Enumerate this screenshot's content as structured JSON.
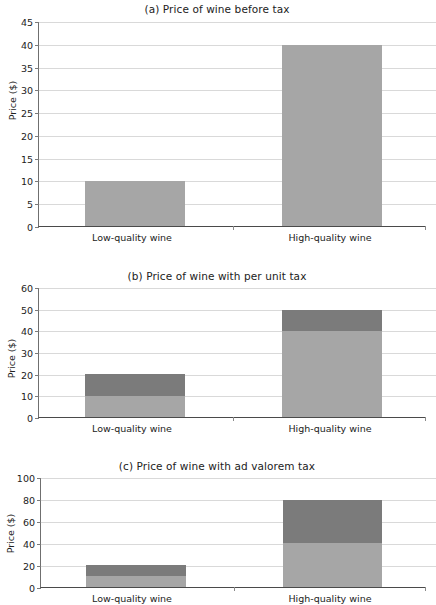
{
  "figure": {
    "ylabel": "Price ($)",
    "categories": [
      "Low-quality wine",
      "High-quality wine"
    ]
  },
  "panels": [
    {
      "id": "a",
      "title": "(a) Price of wine before tax",
      "ylabel": "Price ($)",
      "ymax": 45,
      "ticks": [
        "0",
        "5",
        "10",
        "15",
        "20",
        "25",
        "30",
        "35",
        "40",
        "45"
      ],
      "bars": [
        {
          "category": "Low-quality wine",
          "base": 10,
          "tax": 0,
          "total": 10
        },
        {
          "category": "High-quality wine",
          "base": 40,
          "tax": 0,
          "total": 40
        }
      ]
    },
    {
      "id": "b",
      "title": "(b) Price of wine with per unit tax",
      "ylabel": "Price ($)",
      "ymax": 60,
      "ticks": [
        "0",
        "10",
        "20",
        "30",
        "40",
        "50",
        "60"
      ],
      "bars": [
        {
          "category": "Low-quality wine",
          "base": 10,
          "tax": 10,
          "total": 20
        },
        {
          "category": "High-quality wine",
          "base": 40,
          "tax": 10,
          "total": 50
        }
      ]
    },
    {
      "id": "c",
      "title": "(c) Price of wine with ad valorem tax",
      "ylabel": "Price ($)",
      "ymax": 100,
      "ticks": [
        "0",
        "20",
        "40",
        "60",
        "80",
        "100"
      ],
      "bars": [
        {
          "category": "Low-quality wine",
          "base": 10,
          "tax": 10,
          "total": 20
        },
        {
          "category": "High-quality wine",
          "base": 40,
          "tax": 40,
          "total": 80
        }
      ]
    }
  ],
  "colors": {
    "base_fill": "#a6a6a6",
    "tax_fill": "#7b7b7b",
    "grid": "#d9d9d9",
    "axis": "#4a4a4a",
    "text": "#222222"
  },
  "chart_data": [
    {
      "type": "bar",
      "title": "(a) Price of wine before tax",
      "xlabel": "",
      "ylabel": "Price ($)",
      "ylim": [
        0,
        45
      ],
      "yticks": [
        0,
        5,
        10,
        15,
        20,
        25,
        30,
        35,
        40,
        45
      ],
      "grid": true,
      "legend": "none",
      "categories": [
        "Low-quality wine",
        "High-quality wine"
      ],
      "series": [
        {
          "name": "Pre-tax price",
          "values": [
            10,
            40
          ]
        }
      ]
    },
    {
      "type": "bar",
      "title": "(b) Price of wine with per unit tax",
      "xlabel": "",
      "ylabel": "Price ($)",
      "ylim": [
        0,
        60
      ],
      "yticks": [
        0,
        10,
        20,
        30,
        40,
        50,
        60
      ],
      "grid": true,
      "legend": "none",
      "stacked": true,
      "categories": [
        "Low-quality wine",
        "High-quality wine"
      ],
      "series": [
        {
          "name": "Pre-tax price",
          "values": [
            10,
            40
          ]
        },
        {
          "name": "Per unit tax",
          "values": [
            10,
            10
          ]
        }
      ],
      "totals": [
        20,
        50
      ]
    },
    {
      "type": "bar",
      "title": "(c) Price of wine with ad valorem tax",
      "xlabel": "",
      "ylabel": "Price ($)",
      "ylim": [
        0,
        100
      ],
      "yticks": [
        0,
        20,
        40,
        60,
        80,
        100
      ],
      "grid": true,
      "legend": "none",
      "stacked": true,
      "categories": [
        "Low-quality wine",
        "High-quality wine"
      ],
      "series": [
        {
          "name": "Pre-tax price",
          "values": [
            10,
            40
          ]
        },
        {
          "name": "Ad valorem tax",
          "values": [
            10,
            40
          ]
        }
      ],
      "totals": [
        20,
        80
      ]
    }
  ]
}
